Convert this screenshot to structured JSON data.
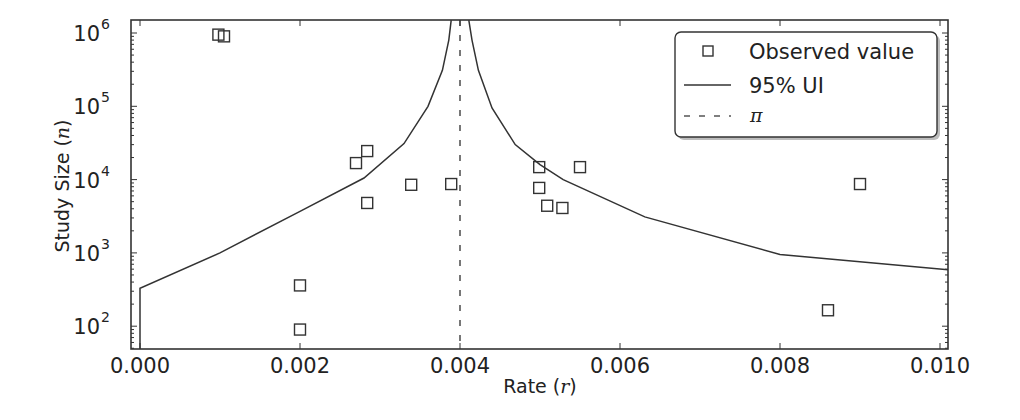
{
  "chart_data": {
    "type": "scatter",
    "title": "",
    "xlabel": "Rate",
    "xlabel_symbol": "r",
    "ylabel": "Study Size",
    "ylabel_symbol": "n",
    "xlim": [
      -0.0001,
      0.0101
    ],
    "ylim": [
      49,
      1500000
    ],
    "yscale": "log",
    "grid": false,
    "legend_position": "upper right",
    "x_ticks": [
      0.0,
      0.002,
      0.004,
      0.006,
      0.008,
      0.01
    ],
    "x_tick_labels": [
      "0.000",
      "0.002",
      "0.004",
      "0.006",
      "0.008",
      "0.010"
    ],
    "y_ticks": [
      100,
      1000,
      10000,
      100000,
      1000000
    ],
    "y_tick_labels": [
      {
        "base": "10",
        "exp": "2"
      },
      {
        "base": "10",
        "exp": "3"
      },
      {
        "base": "10",
        "exp": "4"
      },
      {
        "base": "10",
        "exp": "5"
      },
      {
        "base": "10",
        "exp": "6"
      }
    ],
    "series": [
      {
        "name": "Observed value",
        "type": "scatter",
        "marker": "square-open",
        "points": [
          {
            "x": 0.00098,
            "y": 950000
          },
          {
            "x": 0.00105,
            "y": 900000
          },
          {
            "x": 0.002,
            "y": 360
          },
          {
            "x": 0.002,
            "y": 90
          },
          {
            "x": 0.0027,
            "y": 16800
          },
          {
            "x": 0.00284,
            "y": 24500
          },
          {
            "x": 0.00284,
            "y": 4800
          },
          {
            "x": 0.00339,
            "y": 8500
          },
          {
            "x": 0.00389,
            "y": 8700
          },
          {
            "x": 0.00499,
            "y": 14800
          },
          {
            "x": 0.00499,
            "y": 7700
          },
          {
            "x": 0.00509,
            "y": 4400
          },
          {
            "x": 0.00528,
            "y": 4100
          },
          {
            "x": 0.0055,
            "y": 14800
          },
          {
            "x": 0.0086,
            "y": 165
          },
          {
            "x": 0.009,
            "y": 8700
          }
        ]
      },
      {
        "name": "95% UI",
        "type": "line",
        "style": "solid",
        "segments": [
          [
            {
              "x": 0.0,
              "y": 49
            },
            {
              "x": 0.0,
              "y": 330
            },
            {
              "x": 0.001,
              "y": 1000
            },
            {
              "x": 0.002,
              "y": 3700
            },
            {
              "x": 0.0028,
              "y": 10500
            },
            {
              "x": 0.0033,
              "y": 31000
            },
            {
              "x": 0.0036,
              "y": 100000
            },
            {
              "x": 0.00378,
              "y": 310000
            },
            {
              "x": 0.00386,
              "y": 800000
            },
            {
              "x": 0.00389,
              "y": 1500000
            }
          ],
          [
            {
              "x": 0.00411,
              "y": 1500000
            },
            {
              "x": 0.00415,
              "y": 800000
            },
            {
              "x": 0.00423,
              "y": 310000
            },
            {
              "x": 0.0044,
              "y": 95000
            },
            {
              "x": 0.00469,
              "y": 30000
            },
            {
              "x": 0.005,
              "y": 16000
            },
            {
              "x": 0.00529,
              "y": 10000
            },
            {
              "x": 0.00631,
              "y": 3100
            },
            {
              "x": 0.008,
              "y": 950
            },
            {
              "x": 0.0101,
              "y": 590
            }
          ]
        ]
      },
      {
        "name": "π",
        "type": "vline",
        "style": "dashed",
        "x": 0.004
      }
    ],
    "legend": [
      {
        "label": "Observed value",
        "symbol": "square-open"
      },
      {
        "label": "95% UI",
        "symbol": "solid-line"
      },
      {
        "label": "π",
        "symbol": "dashed-line",
        "math": true
      }
    ]
  },
  "axes": {
    "x_label_text": "Rate (",
    "x_label_symbol": "r",
    "x_label_close": ")",
    "y_label_text": "Study Size (",
    "y_label_symbol": "n",
    "y_label_close": ")"
  },
  "colors": {
    "line": "#333333",
    "marker": "#333333",
    "axis": "#333333",
    "dashed": "#555555"
  }
}
